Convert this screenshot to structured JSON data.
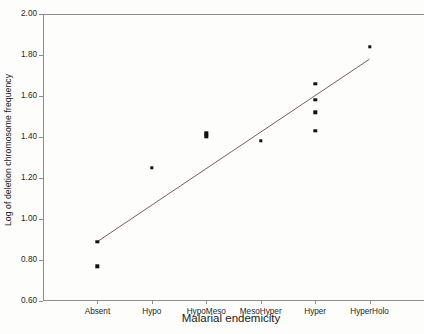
{
  "chart_data": {
    "type": "scatter",
    "title": "",
    "xlabel": "Malarial endemicity",
    "ylabel": "Log of deletion chromosome frequency",
    "categories": [
      "Absent",
      "Hypo",
      "HypoMeso",
      "MesoHyper",
      "Hyper",
      "HyperHolo"
    ],
    "xtick_labels": [
      "Absent",
      "Hypo",
      "HypoMeso",
      "MesoHyper",
      "Hyper",
      "HyperHolo"
    ],
    "ytick_labels": [
      "2.00",
      "1.80",
      "1.60",
      "1.40",
      "1.20",
      "1.00",
      "0.80",
      "0.60"
    ],
    "ytick_values": [
      2.0,
      1.8,
      1.6,
      1.4,
      1.2,
      1.0,
      0.8,
      0.6
    ],
    "ylim": [
      0.6,
      2.0
    ],
    "grid": false,
    "legend": false,
    "marker": "filled-square",
    "marker_color": "#111111",
    "axis_color": "#8d8d91",
    "fit_line_color": "#6b4a52",
    "points": [
      {
        "category": "Absent",
        "x": 1,
        "y": 0.89
      },
      {
        "category": "Absent",
        "x": 1,
        "y": 0.77
      },
      {
        "category": "Hypo",
        "x": 2,
        "y": 1.25
      },
      {
        "category": "HypoMeso",
        "x": 3,
        "y": 1.42
      },
      {
        "category": "HypoMeso",
        "x": 3,
        "y": 1.41
      },
      {
        "category": "HypoMeso",
        "x": 3,
        "y": 1.4
      },
      {
        "category": "MesoHyper",
        "x": 4,
        "y": 1.38
      },
      {
        "category": "Hyper",
        "x": 5,
        "y": 1.66
      },
      {
        "category": "Hyper",
        "x": 5,
        "y": 1.58
      },
      {
        "category": "Hyper",
        "x": 5,
        "y": 1.52
      },
      {
        "category": "Hyper",
        "x": 5,
        "y": 1.43
      },
      {
        "category": "HyperHolo",
        "x": 6,
        "y": 1.84
      }
    ],
    "fit_line": {
      "type": "linear-regression",
      "x_start": 1,
      "y_start": 0.89,
      "x_end": 6,
      "y_end": 1.78
    }
  }
}
